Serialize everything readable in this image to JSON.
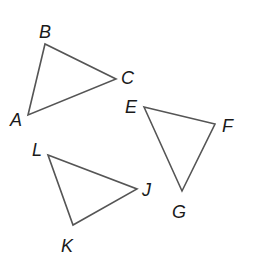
{
  "diagram": {
    "stroke_color": "#555555",
    "label_color": "#1a1a1a",
    "triangles": [
      {
        "name": "ABC",
        "vertices": [
          {
            "label": "A",
            "x": 28,
            "y": 115,
            "lx": 10,
            "ly": 126
          },
          {
            "label": "B",
            "x": 45,
            "y": 44,
            "lx": 39,
            "ly": 38
          },
          {
            "label": "C",
            "x": 116,
            "y": 79,
            "lx": 121,
            "ly": 84
          }
        ]
      },
      {
        "name": "EFG",
        "vertices": [
          {
            "label": "E",
            "x": 144,
            "y": 107,
            "lx": 125,
            "ly": 113
          },
          {
            "label": "F",
            "x": 215,
            "y": 124,
            "lx": 222,
            "ly": 132
          },
          {
            "label": "G",
            "x": 182,
            "y": 191,
            "lx": 172,
            "ly": 218
          }
        ]
      },
      {
        "name": "LJK",
        "vertices": [
          {
            "label": "L",
            "x": 48,
            "y": 155,
            "lx": 32,
            "ly": 156
          },
          {
            "label": "J",
            "x": 137,
            "y": 189,
            "lx": 142,
            "ly": 196
          },
          {
            "label": "K",
            "x": 73,
            "y": 225,
            "lx": 61,
            "ly": 252
          }
        ]
      }
    ]
  }
}
